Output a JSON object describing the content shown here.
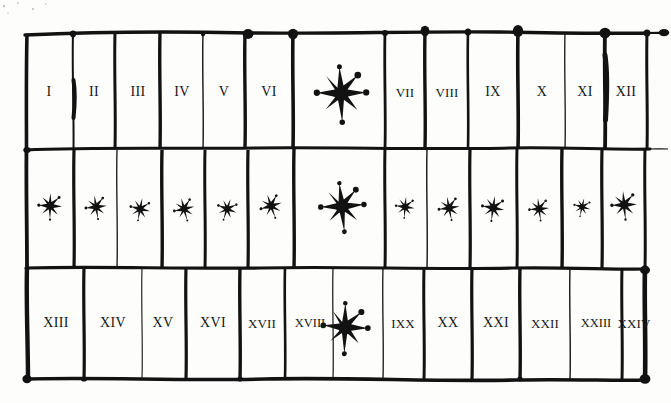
{
  "figure": {
    "medium": "ink-drawing",
    "background_color": "#fdfdfc",
    "ink_color": "#121212",
    "rows": 3,
    "columns_top": 13,
    "columns_middle": 13,
    "columns_bottom": 13,
    "grid_bounds": {
      "left": 26,
      "top": 33,
      "right": 647,
      "bottom": 379
    },
    "row_dividers_y": [
      148,
      268
    ],
    "star_glyph_name": "ink-star-mark"
  },
  "rows": [
    {
      "name": "top-row",
      "y_center": 92,
      "cells": [
        {
          "kind": "label",
          "text": "I",
          "x": 49,
          "w": 47
        },
        {
          "kind": "label",
          "text": "II",
          "x": 94,
          "w": 42
        },
        {
          "kind": "label",
          "text": "III",
          "x": 138,
          "w": 45
        },
        {
          "kind": "label",
          "text": "IV",
          "x": 182,
          "w": 43
        },
        {
          "kind": "label",
          "text": "V",
          "x": 224,
          "w": 42
        },
        {
          "kind": "label",
          "text": "VI",
          "x": 269,
          "w": 48
        },
        {
          "kind": "star",
          "text": "",
          "x": 344,
          "w": 92,
          "size": "large"
        },
        {
          "kind": "label",
          "text": "VII",
          "x": 405,
          "w": 40
        },
        {
          "kind": "label",
          "text": "VIII",
          "x": 447,
          "w": 43
        },
        {
          "kind": "label",
          "text": "IX",
          "x": 493,
          "w": 50
        },
        {
          "kind": "label",
          "text": "X",
          "x": 542,
          "w": 47
        },
        {
          "kind": "label",
          "text": "XI",
          "x": 585,
          "w": 40
        },
        {
          "kind": "label",
          "text": "XII",
          "x": 625,
          "w": 40
        }
      ]
    },
    {
      "name": "middle-row",
      "y_center": 208,
      "cells": [
        {
          "kind": "star",
          "text": "",
          "x": 51,
          "w": 48,
          "size": "small",
          "variant": 1
        },
        {
          "kind": "star",
          "text": "",
          "x": 97,
          "w": 43,
          "size": "small",
          "variant": 2
        },
        {
          "kind": "star",
          "text": "",
          "x": 141,
          "w": 45,
          "size": "small",
          "variant": 3
        },
        {
          "kind": "star",
          "text": "",
          "x": 185,
          "w": 43,
          "size": "small",
          "variant": 4
        },
        {
          "kind": "star",
          "text": "",
          "x": 228,
          "w": 44,
          "size": "small",
          "variant": 5
        },
        {
          "kind": "star",
          "text": "",
          "x": 272,
          "w": 46,
          "size": "small",
          "variant": 6
        },
        {
          "kind": "star",
          "text": "",
          "x": 344,
          "w": 92,
          "size": "large",
          "variant": 7
        },
        {
          "kind": "star",
          "text": "",
          "x": 406,
          "w": 44,
          "size": "small",
          "variant": 8
        },
        {
          "kind": "star",
          "text": "",
          "x": 450,
          "w": 44,
          "size": "small",
          "variant": 9
        },
        {
          "kind": "star",
          "text": "",
          "x": 494,
          "w": 45,
          "size": "small",
          "variant": 10
        },
        {
          "kind": "star",
          "text": "",
          "x": 540,
          "w": 46,
          "size": "small",
          "variant": 11
        },
        {
          "kind": "star",
          "text": "",
          "x": 583,
          "w": 40,
          "size": "small",
          "variant": 12
        },
        {
          "kind": "star",
          "text": "",
          "x": 625,
          "w": 42,
          "size": "medium",
          "variant": 13
        }
      ]
    },
    {
      "name": "bottom-row",
      "y_center": 323,
      "cells": [
        {
          "kind": "label",
          "text": "XIII",
          "x": 56,
          "w": 58
        },
        {
          "kind": "label",
          "text": "XIV",
          "x": 113,
          "w": 55
        },
        {
          "kind": "label",
          "text": "XV",
          "x": 163,
          "w": 46
        },
        {
          "kind": "label",
          "text": "XVI",
          "x": 213,
          "w": 52
        },
        {
          "kind": "label",
          "text": "XVII",
          "x": 262,
          "w": 46
        },
        {
          "kind": "label",
          "text": "XVIII",
          "x": 310,
          "w": 50
        },
        {
          "kind": "star",
          "text": "",
          "x": 348,
          "w": 48,
          "size": "large"
        },
        {
          "kind": "label",
          "text": "IXX",
          "x": 403,
          "w": 42
        },
        {
          "kind": "label",
          "text": "XX",
          "x": 448,
          "w": 47
        },
        {
          "kind": "label",
          "text": "XXI",
          "x": 496,
          "w": 48
        },
        {
          "kind": "label",
          "text": "XXII",
          "x": 545,
          "w": 48
        },
        {
          "kind": "label",
          "text": "XXIII",
          "x": 597,
          "w": 54
        },
        {
          "kind": "label",
          "text": "XXIV",
          "x": 646,
          "w": 52
        }
      ]
    }
  ],
  "vertical_lines": {
    "top_row_x": [
      26,
      73,
      115,
      160,
      203,
      245,
      293,
      385,
      425,
      468,
      518,
      565,
      605,
      647
    ],
    "middle_row_x": [
      26,
      74,
      117,
      162,
      205,
      248,
      294,
      385,
      427,
      470,
      517,
      562,
      602,
      645
    ],
    "bottom_row_x": [
      27,
      84,
      142,
      186,
      240,
      285,
      333,
      383,
      424,
      472,
      520,
      570,
      622,
      645
    ]
  },
  "ink_blobs": {
    "description": "thickened dots where pen strokes cross or terminate",
    "count": 20
  }
}
